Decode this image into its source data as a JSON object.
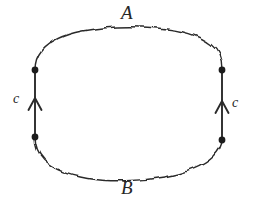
{
  "figure": {
    "background_color": "#ffffff",
    "stroke_color": "#2b2b2b",
    "labels": {
      "top_arc": "A",
      "bottom_arc": "B",
      "left_segment": "c",
      "right_segment": "c"
    },
    "geometry": {
      "left_vertex_top": {
        "x": 35,
        "y": 70
      },
      "left_vertex_bottom": {
        "x": 35,
        "y": 137
      },
      "right_vertex_top": {
        "x": 222,
        "y": 70
      },
      "right_vertex_bottom": {
        "x": 222,
        "y": 140
      },
      "vertex_dot_radius": 3.4,
      "arrow_direction": "up",
      "left_arrow_tip": {
        "x": 35,
        "y": 98
      },
      "right_arrow_tip": {
        "x": 222,
        "y": 101
      },
      "wave_amplitude": 2.0,
      "wave_period": 13.5,
      "stroke_width_curve": 1.5,
      "stroke_width_segment": 1.9
    },
    "paths": {
      "top_arc": "M 35 70 C 35 63 37 56 42 50 C 50 41 64 34 82 31 C 104 27 132 26 158 28 C 180 30 199 36 211 45 C 218 50 222 58 222 70",
      "bottom_arc": "M 35 137 C 35 146 38 154 44 160 C 53 169 68 175 87 178 C 110 182 140 181 165 177 C 186 173 203 166 213 157 C 219 151 222 146 222 140"
    }
  }
}
